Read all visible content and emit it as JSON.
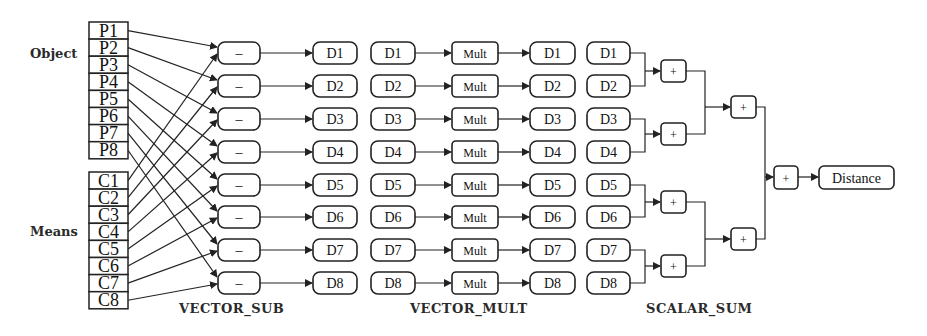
{
  "diagram": {
    "labels": {
      "object": "Object",
      "means": "Means",
      "stage_sub": "VECTOR_SUB",
      "stage_mult": "VECTOR_MULT",
      "stage_sum": "SCALAR_SUM"
    },
    "object_register": [
      "P1",
      "P2",
      "P3",
      "P4",
      "P5",
      "P6",
      "P7",
      "P8"
    ],
    "means_register": [
      "C1",
      "C2",
      "C3",
      "C4",
      "C5",
      "C6",
      "C7",
      "C8"
    ],
    "sub_op": "–",
    "mult_op": "Mult",
    "plus_op": "+",
    "diff_outputs": [
      "D1",
      "D2",
      "D3",
      "D4",
      "D5",
      "D6",
      "D7",
      "D8"
    ],
    "output": "Distance",
    "connections": {
      "object_to_sub": "Pi -> sub i (upper input)",
      "means_to_sub": "Ci -> sub i (lower input)"
    }
  }
}
